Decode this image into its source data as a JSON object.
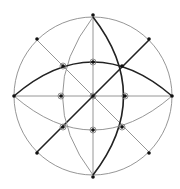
{
  "diagram": {
    "type": "stereographic-net",
    "center": [
      93,
      96
    ],
    "radius": 79,
    "colors": {
      "background": "#ffffff",
      "thin_line": "#8a8a8a",
      "bold_line": "#222222",
      "point": "#111111"
    },
    "primitive_points": [
      [
        93,
        17
      ],
      [
        93,
        175
      ],
      [
        14,
        96
      ],
      [
        172,
        96
      ],
      [
        37,
        40
      ],
      [
        149,
        40
      ],
      [
        37,
        152
      ],
      [
        149,
        152
      ]
    ],
    "inner_points": [
      [
        63,
        66
      ],
      [
        93,
        62
      ],
      [
        122,
        66
      ],
      [
        61,
        96
      ],
      [
        93,
        96
      ],
      [
        125,
        96
      ],
      [
        63,
        127
      ],
      [
        93,
        130
      ],
      [
        122,
        127
      ]
    ],
    "ringed_points": [
      [
        93,
        62
      ],
      [
        61,
        96
      ],
      [
        125,
        96
      ],
      [
        93,
        130
      ],
      [
        93,
        96
      ],
      [
        63,
        127
      ],
      [
        122,
        127
      ],
      [
        63,
        66
      ]
    ],
    "bold_elements": [
      "upper-horizontal-great-circle",
      "right-vertical-great-circle",
      "diagonal-ne-sw"
    ]
  }
}
